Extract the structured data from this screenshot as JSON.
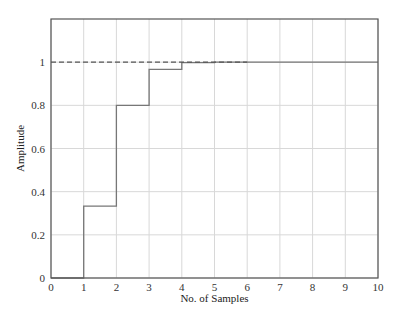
{
  "chart_data": {
    "type": "line",
    "style": "stairs",
    "title": "",
    "xlabel": "No. of Samples",
    "ylabel": "Amplitude",
    "xlim": [
      0,
      10
    ],
    "ylim": [
      0,
      1.2
    ],
    "grid": true,
    "legend": null,
    "x_ticks": [
      "0",
      "1",
      "2",
      "3",
      "4",
      "5",
      "6",
      "7",
      "8",
      "9",
      "10"
    ],
    "y_ticks": [
      "0",
      "0.2",
      "0.4",
      "0.6",
      "0.8",
      "1"
    ],
    "series": [
      {
        "name": "step response",
        "style": "solid",
        "color": "#777777",
        "x": [
          0,
          1,
          2,
          3,
          4,
          5,
          6,
          7,
          8,
          9,
          10
        ],
        "values": [
          0,
          0.333,
          0.8,
          0.967,
          0.998,
          1.0,
          1.0,
          1.0,
          1.0,
          1.0,
          1.0
        ]
      },
      {
        "name": "final value",
        "style": "dashed",
        "color": "#555555",
        "x": [
          0,
          6
        ],
        "values": [
          1,
          1
        ]
      }
    ]
  },
  "colors": {
    "axes": "#555555",
    "grid": "#d8d8d8",
    "series": "#777777",
    "reference": "#555555"
  }
}
